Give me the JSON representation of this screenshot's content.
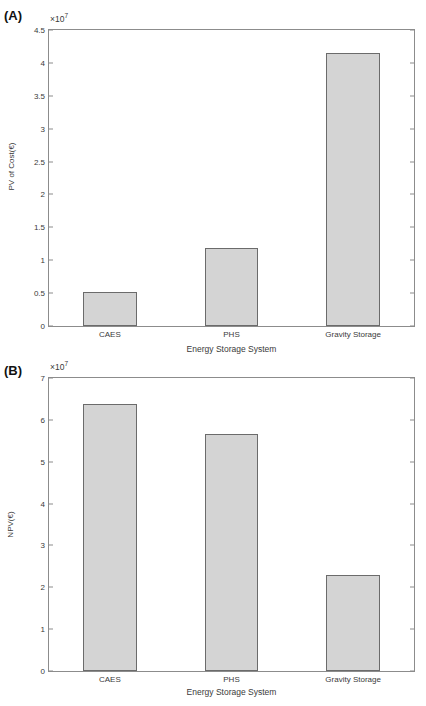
{
  "figure": {
    "background": "#ffffff",
    "bar_fill": "#d4d4d4",
    "bar_edge": "#6b6b6b",
    "axis_color": "#8c8c8c",
    "text_color": "#3a3a3a"
  },
  "panels": [
    {
      "tag": "(A)",
      "exponent_label": "×10",
      "exponent_power": "7"
    },
    {
      "tag": "(B)",
      "exponent_label": "×10",
      "exponent_power": "7"
    }
  ],
  "chart_data": [
    {
      "type": "bar",
      "panel": "(A)",
      "title": "",
      "categories": [
        "CAES",
        "PHS",
        "Gravity Storage"
      ],
      "values": [
        5100000,
        11800000,
        41500000
      ],
      "value_scale": "1e7",
      "xlabel": "Energy Storage System",
      "ylabel": "PV of Cost(€)",
      "ylim": [
        0,
        45000000
      ],
      "yticks": [
        0,
        5000000,
        10000000,
        15000000,
        20000000,
        25000000,
        30000000,
        35000000,
        40000000,
        45000000
      ],
      "ytick_labels": [
        "0",
        "0.5",
        "1",
        "1.5",
        "2",
        "2.5",
        "3",
        "3.5",
        "4",
        "4.5"
      ],
      "y_exponent": "×10⁷",
      "grid": false,
      "legend": null
    },
    {
      "type": "bar",
      "panel": "(B)",
      "title": "",
      "categories": [
        "CAES",
        "PHS",
        "Gravity Storage"
      ],
      "values": [
        63800000,
        56700000,
        23000000
      ],
      "value_scale": "1e7",
      "xlabel": "Energy Storage System",
      "ylabel": "NPV(€)",
      "ylim": [
        0,
        70000000
      ],
      "yticks": [
        0,
        10000000,
        20000000,
        30000000,
        40000000,
        50000000,
        60000000,
        70000000
      ],
      "ytick_labels": [
        "0",
        "1",
        "2",
        "3",
        "4",
        "5",
        "6",
        "7"
      ],
      "y_exponent": "×10⁷",
      "grid": false,
      "legend": null
    }
  ]
}
